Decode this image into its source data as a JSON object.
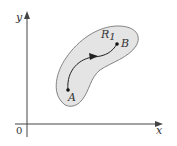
{
  "diagram": {
    "axes": {
      "x_label": "x",
      "y_label": "y",
      "origin_label": "0"
    },
    "region": {
      "label_main": "R",
      "label_sub": "1",
      "fill": "#e4e4e4",
      "stroke": "#777777"
    },
    "points": [
      {
        "name": "A",
        "x": 68,
        "y": 90
      },
      {
        "name": "B",
        "x": 117,
        "y": 44
      }
    ],
    "path": {
      "from": "A",
      "to": "B",
      "direction_arrow": true
    }
  }
}
